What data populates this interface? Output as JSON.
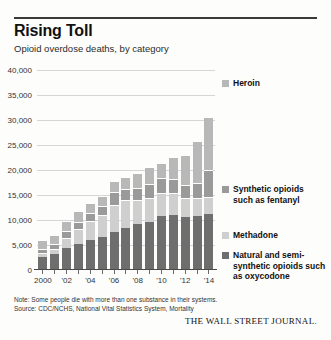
{
  "header": {
    "title": "Rising Toll",
    "subtitle": "Opioid overdose deaths, by category"
  },
  "footer": {
    "note": "Note: Some people die with more than one substance in their systems.",
    "source": "Source: CDC/NCHS, National Vital Statistics System, Mortality",
    "attribution": "THE WALL STREET JOURNAL."
  },
  "chart_data": {
    "type": "bar",
    "stacked": true,
    "title": "Rising Toll",
    "subtitle": "Opioid overdose deaths, by category",
    "xlabel": "",
    "ylabel": "",
    "ylim": [
      0,
      40000
    ],
    "yticks": [
      0,
      5000,
      10000,
      15000,
      20000,
      25000,
      30000,
      35000,
      40000
    ],
    "ytick_labels": [
      "0",
      "5,000",
      "10,000",
      "15,000",
      "20,000",
      "25,000",
      "30,000",
      "35,000",
      "40,000"
    ],
    "grid": true,
    "legend_position": "right",
    "categories": [
      2000,
      2001,
      2002,
      2003,
      2004,
      2005,
      2006,
      2007,
      2008,
      2009,
      2010,
      2011,
      2012,
      2013,
      2014
    ],
    "xtick_labels": [
      "2000",
      "",
      "'02",
      "",
      "'04",
      "",
      "'06",
      "",
      "'08",
      "",
      "'10",
      "",
      "'12",
      "",
      "'14"
    ],
    "series": [
      {
        "name": "Natural and semi-synthetic opioids such as oxycodone",
        "color": "#6e6e6e",
        "values": [
          2700,
          3200,
          4400,
          5300,
          6000,
          6700,
          7600,
          8500,
          9200,
          9700,
          10900,
          11100,
          10600,
          10800,
          11200
        ]
      },
      {
        "name": "Methadone",
        "color": "#cfcfcf",
        "values": [
          800,
          1100,
          2100,
          3000,
          3800,
          4400,
          5400,
          5500,
          4900,
          4700,
          4600,
          4400,
          3900,
          3600,
          3400
        ]
      },
      {
        "name": "Synthetic opioids such as fentanyl",
        "color": "#9a9a9a",
        "values": [
          700,
          900,
          1300,
          1400,
          1700,
          1700,
          2700,
          2200,
          2300,
          2900,
          3000,
          2700,
          2600,
          3100,
          5500
        ]
      },
      {
        "name": "Heroin",
        "color": "#b8b8b8",
        "values": [
          1800,
          1800,
          2100,
          2100,
          2000,
          2000,
          2100,
          2400,
          3000,
          3300,
          3000,
          4400,
          5900,
          8300,
          10500
        ]
      }
    ]
  },
  "legend": [
    {
      "label": "Heroin",
      "color": "#b8b8b8"
    },
    {
      "label": "Synthetic opioids such as fentanyl",
      "color": "#9a9a9a"
    },
    {
      "label": "Methadone",
      "color": "#cfcfcf"
    },
    {
      "label": "Natural and semi-synthetic opioids such as oxycodone",
      "color": "#6e6e6e"
    }
  ]
}
